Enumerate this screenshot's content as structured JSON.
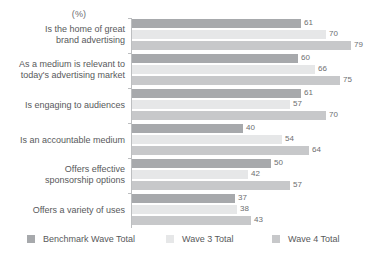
{
  "chart_data": {
    "type": "bar",
    "orientation": "horizontal",
    "title": "",
    "subtitle": "",
    "unit_label": "(%)",
    "xlabel": "",
    "ylabel": "",
    "xlim": [
      0,
      79
    ],
    "grid": false,
    "legend_position": "bottom",
    "categories": [
      "Is the home of great brand advertising",
      "As a medium is relevant to today's advertising market",
      "Is engaging to audiences",
      "Is an accountable medium",
      "Offers effective sponsorship options",
      "Offers a variety of uses"
    ],
    "category_lines": [
      [
        "Is the home of great",
        "brand advertising"
      ],
      [
        "As a medium is relevant to",
        "today's advertising market"
      ],
      [
        "Is engaging to audiences"
      ],
      [
        "Is an accountable medium"
      ],
      [
        "Offers effective",
        "sponsorship options"
      ],
      [
        "Offers a variety of uses"
      ]
    ],
    "series": [
      {
        "name": "Benchmark Wave Total",
        "color": "#a7a9ac",
        "values": [
          61,
          60,
          61,
          40,
          50,
          37
        ]
      },
      {
        "name": "Wave 3 Total",
        "color": "#e6e7e8",
        "values": [
          70,
          66,
          57,
          54,
          42,
          38
        ]
      },
      {
        "name": "Wave 4 Total",
        "color": "#c7c8ca",
        "values": [
          79,
          75,
          70,
          64,
          57,
          43
        ]
      }
    ]
  },
  "colors": {
    "benchmark_wave_total": "#a7a9ac",
    "wave_3_total": "#e6e7e8",
    "wave_4_total": "#c7c8ca",
    "text": "#58595b",
    "value_text": "#6d6e71",
    "axis": "#bcbec0",
    "background": "#ffffff"
  }
}
